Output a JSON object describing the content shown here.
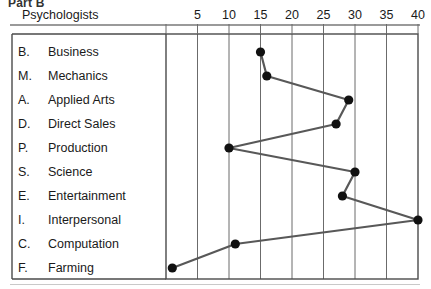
{
  "header": {
    "part_label": "Part B",
    "profile_title": "Psychologists"
  },
  "axis": {
    "ticks": [
      5,
      10,
      15,
      20,
      25,
      30,
      35,
      40
    ],
    "min": 0,
    "max": 40
  },
  "categories": [
    {
      "code": "B.",
      "name": "Business"
    },
    {
      "code": "M.",
      "name": "Mechanics"
    },
    {
      "code": "A.",
      "name": "Applied Arts"
    },
    {
      "code": "D.",
      "name": "Direct Sales"
    },
    {
      "code": "P.",
      "name": "Production"
    },
    {
      "code": "S.",
      "name": "Science"
    },
    {
      "code": "E.",
      "name": "Entertainment"
    },
    {
      "code": "I.",
      "name": "Interpersonal"
    },
    {
      "code": "C.",
      "name": "Computation"
    },
    {
      "code": "F.",
      "name": "Farming"
    }
  ],
  "chart_data": {
    "type": "line",
    "orientation": "horizontal",
    "title": "Psychologists",
    "xlabel": "",
    "ylabel": "",
    "xlim": [
      0,
      40
    ],
    "grid": true,
    "legend": false,
    "categories": [
      "Business",
      "Mechanics",
      "Applied Arts",
      "Direct Sales",
      "Production",
      "Science",
      "Entertainment",
      "Interpersonal",
      "Computation",
      "Farming"
    ],
    "category_codes": [
      "B.",
      "M.",
      "A.",
      "D.",
      "P.",
      "S.",
      "E.",
      "I.",
      "C.",
      "F."
    ],
    "values": [
      15,
      16,
      29,
      27,
      10,
      30,
      28,
      40,
      11,
      1
    ],
    "xticks": [
      5,
      10,
      15,
      20,
      25,
      30,
      35,
      40
    ],
    "marker": "filled-circle",
    "line_color": "#585858",
    "marker_color": "#111111"
  },
  "colors": {
    "grid": "#6b6b6b",
    "border": "#4a4a4a",
    "rule": "#9a9a9a",
    "text": "#1a1a1a"
  }
}
